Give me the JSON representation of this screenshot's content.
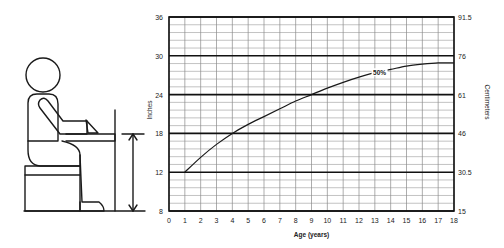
{
  "chart_data": {
    "type": "line",
    "title": "",
    "xlabel": "Age (years)",
    "ylabel": "Inches",
    "ylabel_right": "Centimeters",
    "xlim": [
      0,
      18
    ],
    "x_ticks": [
      0,
      1,
      2,
      3,
      4,
      5,
      6,
      7,
      8,
      9,
      10,
      11,
      12,
      13,
      14,
      15,
      16,
      17,
      18
    ],
    "y_ticks_left": [
      "36",
      "30",
      "24",
      "18",
      "12",
      "8"
    ],
    "y_ticks_right": [
      "91.5",
      "76",
      "61",
      "46",
      "30.5",
      "15"
    ],
    "grid": true,
    "series": [
      {
        "name": "50%",
        "x": [
          1,
          2,
          3,
          4,
          5,
          6,
          7,
          8,
          9,
          10,
          11,
          12,
          13,
          14,
          15,
          16,
          17,
          18
        ],
        "values": [
          12,
          14.3,
          16.3,
          18,
          19.4,
          20.6,
          21.8,
          23,
          24,
          25,
          25.9,
          26.7,
          27.4,
          27.9,
          28.4,
          28.7,
          28.9,
          28.9
        ]
      }
    ],
    "annotations": [
      {
        "text": "50%",
        "x": 13.3,
        "y": 27.3
      }
    ]
  },
  "illustration": {
    "description": "seated-child-at-desk",
    "dimension_arrow": "seat-to-desk-height"
  }
}
